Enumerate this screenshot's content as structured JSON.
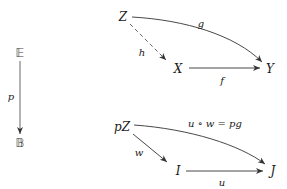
{
  "diagram": {
    "fibration": {
      "top": "𝔼",
      "bottom": "𝔹",
      "arrow_label": "p"
    },
    "upper_square": {
      "objects": {
        "Z": "Z",
        "X": "X",
        "Y": "Y"
      },
      "arrows": {
        "g": "g",
        "h": "h",
        "f": "f"
      }
    },
    "lower_square": {
      "objects": {
        "pZ": "pZ",
        "I": "I",
        "J": "J"
      },
      "arrows": {
        "composite": "u ∘ w = pg",
        "w": "w",
        "u": "u"
      }
    }
  }
}
